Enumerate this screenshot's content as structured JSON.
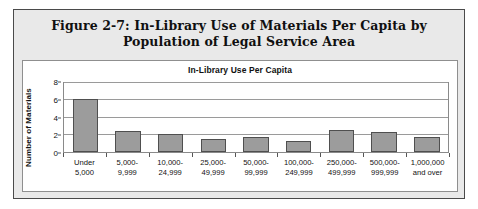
{
  "figure": {
    "title_line1": "Figure 2-7:  In-Library Use of Materials Per Capita by",
    "title_line2": "Population of Legal Service Area"
  },
  "colors": {
    "frame_border": "#4a4a4a",
    "band_background": "#e9e9e9",
    "panel_background": "#ffffff",
    "bar_fill": "#9c9c9c",
    "bar_border": "#4f4f4f",
    "gridline": "#9a9a9a"
  },
  "chart_data": {
    "type": "bar",
    "title": "In-Library Use Per Capita",
    "xlabel": "",
    "ylabel": "Number of Materials",
    "ylim": [
      0,
      8
    ],
    "yticks": [
      0,
      2,
      4,
      6,
      8
    ],
    "grid": true,
    "legend": "none",
    "categories": [
      [
        "Under",
        "5,000"
      ],
      [
        "5,000-",
        "9,999"
      ],
      [
        "10,000-",
        "24,999"
      ],
      [
        "25,000-",
        "49,999"
      ],
      [
        "50,000-",
        "99,999"
      ],
      [
        "100,000-",
        "249,999"
      ],
      [
        "250,000-",
        "499,999"
      ],
      [
        "500,000-",
        "999,999"
      ],
      [
        "1,000,000",
        "and over"
      ]
    ],
    "values": [
      6.2,
      2.4,
      2.1,
      1.5,
      1.7,
      1.3,
      2.6,
      2.3,
      1.7
    ]
  }
}
